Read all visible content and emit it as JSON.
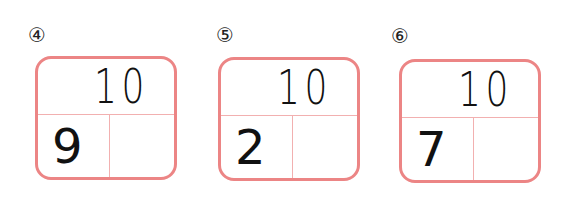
{
  "colors": {
    "border": "#ec8585",
    "divider": "#f2b0b0",
    "ink": "#111111"
  },
  "problems": [
    {
      "label": "④",
      "total": "10",
      "part": "9",
      "answer": ""
    },
    {
      "label": "⑤",
      "total": "10",
      "part": "2",
      "answer": ""
    },
    {
      "label": "⑥",
      "total": "10",
      "part": "7",
      "answer": ""
    }
  ]
}
